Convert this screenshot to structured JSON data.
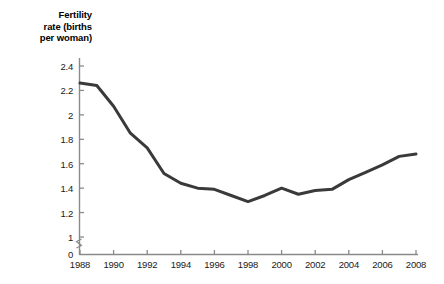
{
  "axis_title": "Fertility\nrate (births\nper woman)",
  "colors": {
    "line": "#3a3a3a",
    "axis": "#8a8a8a",
    "text": "#111111",
    "background": "#ffffff"
  },
  "y_axis": {
    "labels": [
      "0",
      "1",
      "1.2",
      "1.4",
      "1.6",
      "1.8",
      "2",
      "2.2",
      "2.4"
    ],
    "has_break": true,
    "break_between": [
      "0",
      "1"
    ]
  },
  "x_axis": {
    "labels": [
      "1988",
      "1990",
      "1992",
      "1994",
      "1996",
      "1998",
      "2000",
      "2002",
      "2004",
      "2006",
      "2008"
    ]
  },
  "chart_data": {
    "type": "line",
    "title": "",
    "subtitle": "",
    "xlabel": "",
    "ylabel": "Fertility rate (births per woman)",
    "xlim": [
      1988,
      2008
    ],
    "ylim": [
      1.0,
      2.4
    ],
    "grid": false,
    "legend": "none",
    "axis_break": {
      "from": 0,
      "to": 1,
      "axis": "y"
    },
    "xtick_labels": [
      "1988",
      "1990",
      "1992",
      "1994",
      "1996",
      "1998",
      "2000",
      "2002",
      "2004",
      "2006",
      "2008"
    ],
    "ytick_labels": [
      "0",
      "1",
      "1.2",
      "1.4",
      "1.6",
      "1.8",
      "2",
      "2.2",
      "2.4"
    ],
    "x": [
      1988,
      1989,
      1990,
      1991,
      1992,
      1993,
      1994,
      1995,
      1996,
      1997,
      1998,
      1999,
      2000,
      2001,
      2002,
      2003,
      2004,
      2005,
      2006,
      2007,
      2008
    ],
    "values": [
      2.26,
      2.24,
      2.07,
      1.85,
      1.73,
      1.52,
      1.44,
      1.4,
      1.39,
      1.34,
      1.29,
      1.34,
      1.4,
      1.35,
      1.38,
      1.39,
      1.47,
      1.53,
      1.59,
      1.66,
      1.68
    ],
    "series": [
      {
        "name": "Fertility rate",
        "values": [
          2.26,
          2.24,
          2.07,
          1.85,
          1.73,
          1.52,
          1.44,
          1.4,
          1.39,
          1.34,
          1.29,
          1.34,
          1.4,
          1.35,
          1.38,
          1.39,
          1.47,
          1.53,
          1.59,
          1.66,
          1.68
        ]
      }
    ]
  }
}
